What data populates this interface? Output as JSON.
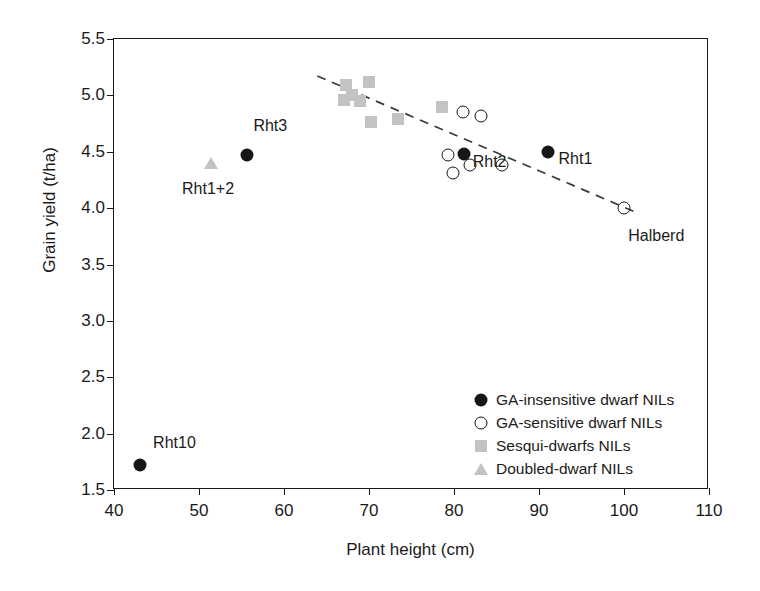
{
  "chart_data": {
    "type": "scatter",
    "title": "",
    "xlabel": "Plant height (cm)",
    "ylabel": "Grain yield (t/ha)",
    "xlim": [
      40,
      110
    ],
    "ylim": [
      1.5,
      5.5
    ],
    "xticks": [
      "40",
      "50",
      "60",
      "70",
      "80",
      "90",
      "100",
      "110"
    ],
    "yticks": [
      "1.5",
      "2.0",
      "2.5",
      "3.0",
      "3.5",
      "4.0",
      "4.5",
      "5.0",
      "5.5"
    ],
    "grid": false,
    "legend_position": "bottom-right",
    "colors": {
      "filled": "#161616",
      "open_outline": "#161616",
      "square": "#c3c3c3",
      "triangle": "#c3c3c3",
      "axis": "#1a1a1a",
      "trendline": "#3a3a3a"
    },
    "series": [
      {
        "name": "GA-insensitive dwarf NILs",
        "marker": "filled-circle",
        "points": [
          {
            "x": 43.0,
            "y": 1.72,
            "label": "Rht10"
          },
          {
            "x": 55.6,
            "y": 4.47,
            "label": "Rht3"
          },
          {
            "x": 81.2,
            "y": 4.48,
            "label": "Rht2"
          },
          {
            "x": 91.0,
            "y": 4.5,
            "label": "Rht1"
          }
        ]
      },
      {
        "name": "GA-sensitive dwarf NILs",
        "marker": "open-circle",
        "points": [
          {
            "x": 81.0,
            "y": 4.85,
            "label": ""
          },
          {
            "x": 83.2,
            "y": 4.82,
            "label": ""
          },
          {
            "x": 79.3,
            "y": 4.47,
            "label": ""
          },
          {
            "x": 79.9,
            "y": 4.31,
            "label": ""
          },
          {
            "x": 81.9,
            "y": 4.38,
            "label": ""
          },
          {
            "x": 85.6,
            "y": 4.38,
            "label": ""
          },
          {
            "x": 100.0,
            "y": 4.0,
            "label": "Halberd"
          }
        ]
      },
      {
        "name": "Sesqui-dwarfs NILs",
        "marker": "square",
        "points": [
          {
            "x": 67.3,
            "y": 5.09,
            "label": ""
          },
          {
            "x": 70.0,
            "y": 5.12,
            "label": ""
          },
          {
            "x": 67.0,
            "y": 4.96,
            "label": ""
          },
          {
            "x": 68.0,
            "y": 5.0,
            "label": ""
          },
          {
            "x": 68.9,
            "y": 4.95,
            "label": ""
          },
          {
            "x": 70.2,
            "y": 4.76,
            "label": ""
          },
          {
            "x": 73.4,
            "y": 4.79,
            "label": ""
          },
          {
            "x": 78.6,
            "y": 4.9,
            "label": ""
          }
        ]
      },
      {
        "name": "Doubled-dwarf NILs",
        "marker": "triangle",
        "points": [
          {
            "x": 51.4,
            "y": 4.4,
            "label": "Rht1+2"
          }
        ]
      }
    ],
    "trendline": {
      "style": "dashed",
      "x_start": 64.0,
      "y_start": 5.17,
      "x_end": 101.5,
      "y_end": 3.96
    },
    "annotations": [
      {
        "text": "Rht10",
        "x": 44.6,
        "y": 1.92
      },
      {
        "text": "Rht3",
        "x": 56.4,
        "y": 4.73
      },
      {
        "text": "Rht1+2",
        "x": 48.0,
        "y": 4.17
      },
      {
        "text": "Rht2",
        "x": 82.2,
        "y": 4.41
      },
      {
        "text": "Rht1",
        "x": 92.3,
        "y": 4.44
      },
      {
        "text": "Halberd",
        "x": 100.5,
        "y": 3.75
      }
    ]
  },
  "legend": {
    "items": [
      {
        "label": "GA-insensitive dwarf NILs",
        "marker": "filled-circle"
      },
      {
        "label": "GA-sensitive dwarf NILs",
        "marker": "open-circle"
      },
      {
        "label": "Sesqui-dwarfs NILs",
        "marker": "square"
      },
      {
        "label": "Doubled-dwarf NILs",
        "marker": "triangle"
      }
    ]
  }
}
